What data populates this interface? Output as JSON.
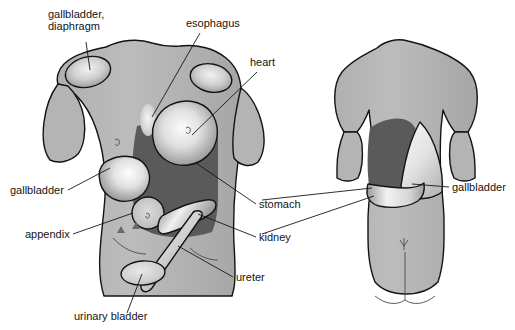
{
  "figure": {
    "background_color": "#ffffff",
    "skin_color": "#b8b8b8",
    "skin_shadow_color": "#9c9c9c",
    "organ_dark_color": "#5a5a5a",
    "organ_light_color": "#efefef",
    "outline_color": "#141414",
    "label_color": "#141414"
  },
  "views": [
    {
      "name": "anterior-view",
      "description": "Front view of torso showing referred pain regions"
    },
    {
      "name": "posterior-view",
      "description": "Back view of torso showing referred pain regions"
    }
  ],
  "labels": [
    {
      "id": "gallbladder-diaphragm",
      "text_lines": [
        "gallbladder,",
        "diaphragm"
      ],
      "x": 48,
      "y": 18,
      "anchor": "start",
      "view": "anterior"
    },
    {
      "id": "esophagus",
      "text_lines": [
        "esophagus"
      ],
      "x": 186,
      "y": 27,
      "anchor": "start",
      "view": "anterior"
    },
    {
      "id": "heart",
      "text_lines": [
        "heart"
      ],
      "x": 250,
      "y": 66,
      "anchor": "start",
      "view": "anterior"
    },
    {
      "id": "gallbladder-left",
      "text_lines": [
        "gallbladder"
      ],
      "x": 10,
      "y": 194,
      "anchor": "start",
      "view": "anterior"
    },
    {
      "id": "appendix",
      "text_lines": [
        "appendix"
      ],
      "x": 25,
      "y": 238,
      "anchor": "start",
      "view": "anterior"
    },
    {
      "id": "urinary-bladder",
      "text_lines": [
        "urinary bladder"
      ],
      "x": 74,
      "y": 320,
      "anchor": "start",
      "view": "anterior"
    },
    {
      "id": "stomach",
      "text_lines": [
        "stomach"
      ],
      "x": 259,
      "y": 208,
      "anchor": "start",
      "view": "anterior"
    },
    {
      "id": "kidney",
      "text_lines": [
        "kidney"
      ],
      "x": 259,
      "y": 241,
      "anchor": "start",
      "view": "anterior"
    },
    {
      "id": "ureter",
      "text_lines": [
        "ureter"
      ],
      "x": 236,
      "y": 281,
      "anchor": "start",
      "view": "anterior"
    },
    {
      "id": "gallbladder-right",
      "text_lines": [
        "gallbladder"
      ],
      "x": 452,
      "y": 191,
      "anchor": "start",
      "view": "posterior"
    }
  ],
  "regions": [
    {
      "id": "right-shoulder-patch",
      "organ": "gallbladder, diaphragm",
      "shade": "light",
      "view": "anterior"
    },
    {
      "id": "left-shoulder-patch",
      "organ": "gallbladder, diaphragm",
      "shade": "light",
      "view": "anterior"
    },
    {
      "id": "esophagus-patch",
      "organ": "esophagus",
      "shade": "light",
      "view": "anterior"
    },
    {
      "id": "heart-patch",
      "organ": "heart",
      "shade": "light",
      "view": "anterior"
    },
    {
      "id": "stomach-patch",
      "organ": "stomach",
      "shade": "dark",
      "view": "anterior"
    },
    {
      "id": "gallbladder-patch",
      "organ": "gallbladder",
      "shade": "light",
      "view": "anterior"
    },
    {
      "id": "appendix-patch",
      "organ": "appendix",
      "shade": "light",
      "view": "anterior"
    },
    {
      "id": "kidney-patch",
      "organ": "kidney",
      "shade": "light",
      "view": "anterior"
    },
    {
      "id": "ureter-patch",
      "organ": "ureter",
      "shade": "light",
      "view": "anterior"
    },
    {
      "id": "urinary-bladder-patch",
      "organ": "urinary bladder",
      "shade": "light",
      "view": "anterior"
    },
    {
      "id": "stomach-patch-back",
      "organ": "stomach",
      "shade": "dark",
      "view": "posterior"
    },
    {
      "id": "kidney-patch-back",
      "organ": "kidney",
      "shade": "light",
      "view": "posterior"
    },
    {
      "id": "gallbladder-patch-back",
      "organ": "gallbladder",
      "shade": "light",
      "view": "posterior"
    }
  ]
}
